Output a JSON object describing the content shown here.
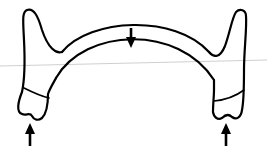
{
  "diagram": {
    "type": "dental-arch-force-illustration",
    "colors": {
      "stroke": "#000000",
      "background": "#ffffff",
      "guide_line": "#cfcfcf"
    },
    "elements": {
      "arch_wire": {
        "shape": "double-arc",
        "span": "left tooth to right tooth"
      },
      "left_tooth": {
        "has_crown_line": true
      },
      "right_tooth": {
        "has_crown_line": true
      },
      "arrows": [
        {
          "id": "center",
          "direction": "down",
          "x": 131,
          "y_from": 29,
          "y_to": 47
        },
        {
          "id": "left",
          "direction": "up",
          "x": 30,
          "y_from": 145,
          "y_to": 123
        },
        {
          "id": "right",
          "direction": "up",
          "x": 226,
          "y_from": 145,
          "y_to": 123
        }
      ]
    }
  }
}
